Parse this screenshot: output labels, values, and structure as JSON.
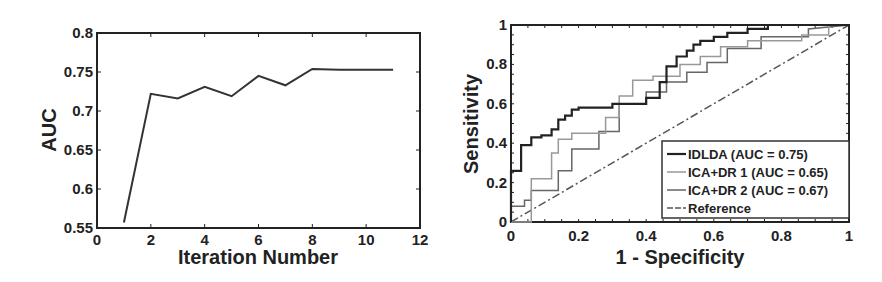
{
  "chart_data": [
    {
      "type": "line",
      "title": "",
      "xlabel": "Iteration Number",
      "ylabel": "AUC",
      "xlim": [
        0,
        12
      ],
      "ylim": [
        0.55,
        0.8
      ],
      "xticks": [
        "0",
        "2",
        "4",
        "6",
        "8",
        "10",
        "12"
      ],
      "yticks": [
        "0.55",
        "0.6",
        "0.65",
        "0.7",
        "0.75",
        "0.8"
      ],
      "grid": false,
      "series": [
        {
          "name": "AUC",
          "x": [
            1,
            2,
            3,
            4,
            5,
            6,
            7,
            8,
            9,
            10,
            11
          ],
          "values": [
            0.557,
            0.722,
            0.716,
            0.731,
            0.719,
            0.745,
            0.733,
            0.754,
            0.753,
            0.753,
            0.753
          ]
        }
      ]
    },
    {
      "type": "line",
      "title": "",
      "xlabel": "1 - Specificity",
      "ylabel": "Sensitivity",
      "xlim": [
        0,
        1
      ],
      "ylim": [
        0,
        1
      ],
      "xticks": [
        "0",
        "0.2",
        "0.4",
        "0.6",
        "0.8",
        "1"
      ],
      "yticks": [
        "0",
        "0.2",
        "0.4",
        "0.6",
        "0.8",
        "1"
      ],
      "grid": false,
      "legend_position": "lower right",
      "series": [
        {
          "name": "IDLDA (AUC = 0.75)",
          "color": "#222222",
          "x": [
            0,
            0,
            0.03,
            0.03,
            0.06,
            0.06,
            0.09,
            0.09,
            0.12,
            0.12,
            0.14,
            0.14,
            0.16,
            0.16,
            0.18,
            0.18,
            0.2,
            0.2,
            0.3,
            0.3,
            0.4,
            0.4,
            0.44,
            0.44,
            0.46,
            0.46,
            0.49,
            0.49,
            0.52,
            0.52,
            0.54,
            0.54,
            0.56,
            0.56,
            0.6,
            0.6,
            0.64,
            0.64,
            0.7,
            0.7,
            0.76,
            0.76,
            0.8,
            0.8,
            1
          ],
          "values": [
            0,
            0.26,
            0.26,
            0.39,
            0.39,
            0.43,
            0.43,
            0.44,
            0.44,
            0.47,
            0.47,
            0.52,
            0.52,
            0.54,
            0.54,
            0.57,
            0.57,
            0.58,
            0.58,
            0.6,
            0.6,
            0.63,
            0.63,
            0.71,
            0.71,
            0.79,
            0.79,
            0.84,
            0.84,
            0.87,
            0.87,
            0.9,
            0.9,
            0.92,
            0.92,
            0.94,
            0.94,
            0.96,
            0.96,
            0.98,
            0.98,
            1,
            1,
            1,
            1
          ]
        },
        {
          "name": "ICA+DR 1 (AUC = 0.65)",
          "color": "#999999",
          "x": [
            0,
            0.06,
            0.06,
            0.12,
            0.12,
            0.14,
            0.14,
            0.18,
            0.18,
            0.28,
            0.28,
            0.32,
            0.32,
            0.36,
            0.36,
            0.42,
            0.42,
            0.5,
            0.5,
            0.56,
            0.56,
            0.62,
            0.62,
            0.7,
            0.7,
            0.86,
            0.86,
            0.94,
            0.94,
            1
          ],
          "values": [
            0,
            0,
            0.22,
            0.22,
            0.35,
            0.35,
            0.42,
            0.42,
            0.45,
            0.45,
            0.53,
            0.53,
            0.64,
            0.64,
            0.72,
            0.72,
            0.74,
            0.74,
            0.8,
            0.8,
            0.84,
            0.84,
            0.89,
            0.89,
            0.92,
            0.92,
            0.95,
            0.95,
            1,
            1
          ]
        },
        {
          "name": "ICA+DR 2 (AUC = 0.67)",
          "color": "#666666",
          "x": [
            0,
            0,
            0.04,
            0.04,
            0.06,
            0.06,
            0.14,
            0.14,
            0.18,
            0.18,
            0.26,
            0.26,
            0.32,
            0.32,
            0.4,
            0.4,
            0.46,
            0.46,
            0.52,
            0.52,
            0.58,
            0.58,
            0.64,
            0.64,
            0.74,
            0.74,
            0.88,
            0.88,
            1
          ],
          "values": [
            0,
            0.08,
            0.08,
            0.11,
            0.11,
            0.16,
            0.16,
            0.26,
            0.26,
            0.37,
            0.37,
            0.46,
            0.46,
            0.6,
            0.6,
            0.66,
            0.66,
            0.71,
            0.71,
            0.76,
            0.76,
            0.81,
            0.81,
            0.88,
            0.88,
            0.94,
            0.94,
            0.98,
            1
          ]
        },
        {
          "name": "Reference",
          "color": "#555555",
          "style": "dash-dot",
          "x": [
            0,
            1
          ],
          "values": [
            0,
            1
          ]
        }
      ]
    }
  ],
  "left_chart": {
    "xlabel": "Iteration Number",
    "ylabel": "AUC"
  },
  "right_chart": {
    "xlabel": "1 - Specificity",
    "ylabel": "Sensitivity",
    "legend": [
      "IDLDA (AUC = 0.75)",
      "ICA+DR 1 (AUC = 0.65)",
      "ICA+DR 2 (AUC = 0.67)",
      "Reference"
    ]
  }
}
